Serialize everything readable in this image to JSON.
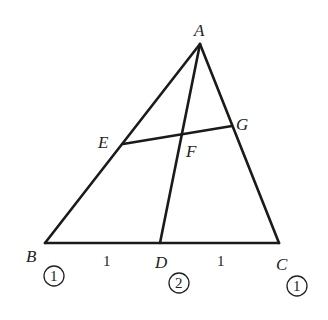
{
  "diagram": {
    "points": {
      "A": {
        "label": "A",
        "x": 200,
        "y": 44
      },
      "B": {
        "label": "B",
        "x": 45,
        "y": 243
      },
      "C": {
        "label": "C",
        "x": 279,
        "y": 243
      },
      "D": {
        "label": "D",
        "x": 160,
        "y": 243
      },
      "E": {
        "label": "E",
        "x": 123,
        "y": 144
      },
      "F": {
        "label": "F",
        "x": 181,
        "y": 133
      },
      "G": {
        "label": "G",
        "x": 232,
        "y": 126
      }
    },
    "segments": [
      "AB",
      "AC",
      "BC",
      "AD",
      "EG"
    ],
    "segment_lengths": {
      "BD": "1",
      "DC": "1"
    },
    "weights": {
      "B": "1",
      "D": "2",
      "C": "1"
    }
  }
}
